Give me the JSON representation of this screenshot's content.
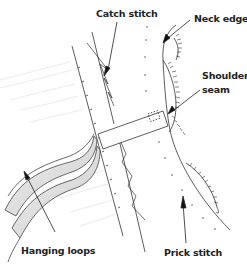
{
  "diagram": {
    "labels": {
      "catch_stitch": "Catch stitch",
      "neck_edge": "Neck edge",
      "shoulder_seam_line1": "Shoulder",
      "shoulder_seam_line2": "seam",
      "hanging_loops": "Hanging loops",
      "prick_stitch": "Prick stitch"
    },
    "colors": {
      "line": "#333333",
      "loop_fill": "#d8d8d8",
      "background": "#ffffff"
    }
  }
}
